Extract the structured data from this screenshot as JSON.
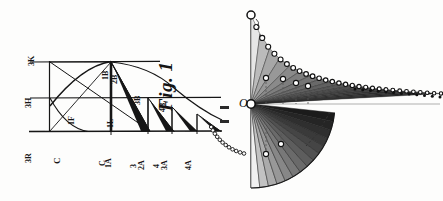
{
  "plate": {
    "background_color": "#fdfdfc",
    "ink_color": "#141414",
    "caption": "Fig. 1"
  },
  "left_figure": {
    "name": "hand-drawn-geometric-construction",
    "caption": "Fig. 1",
    "description": "Hand-drawn geometric construction with horizontal baselines, a descending curve and a series of right triangles; all lettering is rotated ninety degrees.",
    "labels": [
      {
        "text": "3K",
        "x": 36,
        "y": 58,
        "rotated": true,
        "size": 8
      },
      {
        "text": "3H",
        "x": 33,
        "y": 100,
        "rotated": true,
        "size": 8
      },
      {
        "text": "3R",
        "x": 33,
        "y": 155,
        "rotated": true,
        "size": 8
      },
      {
        "text": "C",
        "x": 62,
        "y": 155,
        "rotated": true,
        "size": 9
      },
      {
        "text": "1F",
        "x": 76,
        "y": 117,
        "rotated": true,
        "size": 8
      },
      {
        "text": "1B",
        "x": 110,
        "y": 72,
        "rotated": true,
        "size": 8
      },
      {
        "text": "2B",
        "x": 119,
        "y": 76,
        "rotated": true,
        "size": 8
      },
      {
        "text": "1L",
        "x": 115,
        "y": 120,
        "rotated": true,
        "size": 8
      },
      {
        "text": "3B",
        "x": 142,
        "y": 97,
        "rotated": true,
        "size": 8
      },
      {
        "text": "4B",
        "x": 167,
        "y": 104,
        "rotated": true,
        "size": 8
      },
      {
        "text": "C",
        "x": 107,
        "y": 158,
        "rotated": true,
        "size": 8
      },
      {
        "text": "1A",
        "x": 113,
        "y": 160,
        "rotated": true,
        "size": 8
      },
      {
        "text": "3",
        "x": 138,
        "y": 160,
        "rotated": true,
        "size": 8
      },
      {
        "text": "2A",
        "x": 146,
        "y": 162,
        "rotated": true,
        "size": 8
      },
      {
        "text": "4",
        "x": 161,
        "y": 160,
        "rotated": true,
        "size": 8
      },
      {
        "text": "3A",
        "x": 169,
        "y": 162,
        "rotated": true,
        "size": 8
      },
      {
        "text": "4A",
        "x": 193,
        "y": 162,
        "rotated": true,
        "size": 8
      }
    ],
    "baselines": [
      {
        "name": "upper-baseline",
        "y": 62
      },
      {
        "name": "middle-baseline",
        "y": 98
      },
      {
        "name": "lower-baseline",
        "y": 131
      }
    ],
    "triangles": [
      {
        "name": "triangle-1",
        "apex_x": 111,
        "apex_y": 62,
        "base_x": 111,
        "foot_x": 148
      },
      {
        "name": "triangle-2",
        "apex_x": 148,
        "apex_y": 98,
        "base_x": 148,
        "foot_x": 172
      },
      {
        "name": "triangle-3",
        "apex_x": 172,
        "apex_y": 107,
        "base_x": 172,
        "foot_x": 197
      },
      {
        "name": "triangle-4",
        "apex_x": 197,
        "apex_y": 114,
        "base_x": 197,
        "foot_x": 221
      }
    ]
  },
  "right_figure": {
    "name": "rendered-fan-and-curve-diagram",
    "description": "Rendered diagram: a vertical axis with an apex circle at top, a pivot marked O at mid-height, an upper fan of narrow wedges following a hyperbolic curve of small circles running to the right, and a lower quarter-circle fan of graded wedges.",
    "pivot_label": "O",
    "pivot_x": 251,
    "pivot_y": 104,
    "apex_x": 251,
    "apex_y": 15,
    "upper_wedge_count": 18,
    "lower_wedge_count": 14,
    "curve_marker_count": 30,
    "dotted_tail_marker_count": 12,
    "axis_color": "#4a4a4a",
    "wedge_dark_color": "#1b1b1b",
    "wedge_light_color": "#e6e6e6",
    "marker_fill": "#ffffff",
    "marker_stroke": "#111111",
    "margin_dashes": [
      {
        "name": "margin-dash-upper",
        "x": 220,
        "y": 106,
        "w": 9,
        "h": 3
      },
      {
        "name": "margin-dash-lower",
        "x": 220,
        "y": 120,
        "w": 9,
        "h": 3
      }
    ]
  }
}
